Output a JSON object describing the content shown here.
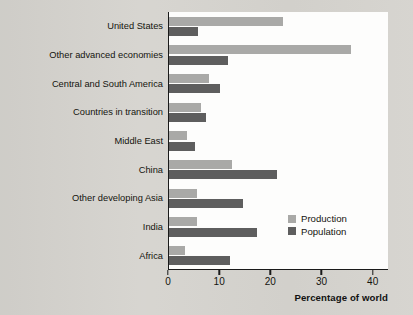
{
  "chart_data": {
    "type": "bar",
    "orientation": "horizontal",
    "title": "",
    "subtitle": "",
    "xlabel": "Percentage of world",
    "ylabel": "",
    "xlim": [
      0,
      43
    ],
    "xticks": [
      0,
      10,
      20,
      30,
      40
    ],
    "xticklabels": [
      "0",
      "10",
      "20",
      "30",
      "40"
    ],
    "grid": false,
    "legend_position": "inside-lower-right",
    "categories": [
      "United States",
      "Other advanced economies",
      "Central and South America",
      "Countries in transition",
      "Middle East",
      "China",
      "Other developing Asia",
      "India",
      "Africa"
    ],
    "series": [
      {
        "name": "Production",
        "color": "#a9a9a7",
        "values": [
          22.2,
          35.5,
          7.9,
          6.2,
          3.5,
          12.4,
          5.4,
          5.4,
          3.1
        ]
      },
      {
        "name": "Population",
        "color": "#5e5e5e",
        "values": [
          5.6,
          11.5,
          9.9,
          7.3,
          5.0,
          21.2,
          14.4,
          17.2,
          11.9
        ]
      }
    ]
  },
  "colors": {
    "background": "#d6d4cf",
    "plot_background": "#fdfdfc",
    "axis": "#1a1a1a",
    "production": "#a9a9a7",
    "population": "#5e5e5e",
    "text": "#14140e"
  }
}
